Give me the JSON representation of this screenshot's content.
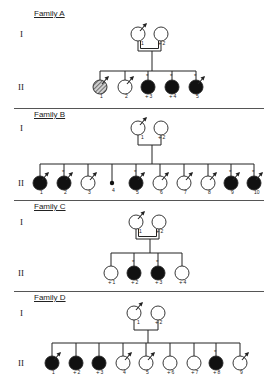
{
  "figure": {
    "generation_labels": [
      "I",
      "II"
    ],
    "colors": {
      "line": "#222222",
      "affected": "#111111",
      "unaffected": "#ffffff",
      "hatched": "#999999"
    }
  },
  "families": [
    {
      "title": "Family A",
      "y_title": 14,
      "y_gen1": 34,
      "y_gen2": 87,
      "consanguineous": true,
      "parents": [
        {
          "id": "1",
          "x": 138,
          "status": "unaffected",
          "arrow": true,
          "plus": false
        },
        {
          "id": "2",
          "x": 161,
          "status": "unaffected",
          "arrow": false,
          "plus": true
        }
      ],
      "sib_line_y": 71,
      "children": [
        {
          "id": "1",
          "x": 100,
          "status": "hatched",
          "arrow": true,
          "star": false,
          "plus": false
        },
        {
          "id": "2",
          "x": 125,
          "status": "unaffected",
          "arrow": true,
          "star": false,
          "plus": false
        },
        {
          "id": "3",
          "x": 148,
          "status": "affected",
          "arrow": false,
          "star": true,
          "plus": true
        },
        {
          "id": "4",
          "x": 172,
          "status": "affected",
          "arrow": false,
          "star": true,
          "plus": true
        },
        {
          "id": "5",
          "x": 196,
          "status": "affected",
          "arrow": true,
          "star": true,
          "plus": false
        }
      ]
    },
    {
      "title": "Family B",
      "y_title": 115,
      "y_gen1": 128,
      "y_gen2": 183,
      "consanguineous": false,
      "parents": [
        {
          "id": "1",
          "x": 138,
          "status": "unaffected",
          "arrow": true,
          "plus": false
        },
        {
          "id": "2",
          "x": 161,
          "status": "unaffected",
          "arrow": false,
          "plus": true
        }
      ],
      "sib_line_y": 164,
      "children": [
        {
          "id": "1",
          "x": 40,
          "status": "affected",
          "arrow": true,
          "star": false,
          "plus": false
        },
        {
          "id": "2",
          "x": 64,
          "status": "affected",
          "arrow": true,
          "star": true,
          "plus": false
        },
        {
          "id": "3",
          "x": 88,
          "status": "unaffected",
          "arrow": true,
          "star": false,
          "plus": false
        },
        {
          "id": "4",
          "x": 112,
          "status": "small",
          "arrow": false,
          "star": false,
          "plus": false
        },
        {
          "id": "5",
          "x": 136,
          "status": "affected",
          "arrow": true,
          "star": true,
          "plus": false
        },
        {
          "id": "6",
          "x": 160,
          "status": "unaffected",
          "arrow": true,
          "star": false,
          "plus": false
        },
        {
          "id": "7",
          "x": 184,
          "status": "unaffected",
          "arrow": true,
          "star": false,
          "plus": false
        },
        {
          "id": "8",
          "x": 208,
          "status": "unaffected",
          "arrow": true,
          "star": false,
          "plus": false
        },
        {
          "id": "9",
          "x": 231,
          "status": "affected",
          "arrow": true,
          "star": true,
          "plus": false
        },
        {
          "id": "10",
          "x": 254,
          "status": "affected",
          "arrow": true,
          "star": true,
          "plus": false
        }
      ]
    },
    {
      "title": "Family C",
      "y_title": 207,
      "y_gen1": 222,
      "y_gen2": 273,
      "consanguineous": true,
      "parents": [
        {
          "id": "1",
          "x": 136,
          "status": "unaffected",
          "arrow": true,
          "plus": false
        },
        {
          "id": "2",
          "x": 159,
          "status": "unaffected",
          "arrow": false,
          "plus": true
        }
      ],
      "sib_line_y": 253,
      "children": [
        {
          "id": "1",
          "x": 111,
          "status": "unaffected",
          "arrow": false,
          "star": false,
          "plus": true
        },
        {
          "id": "2",
          "x": 134,
          "status": "affected",
          "arrow": false,
          "star": true,
          "plus": true
        },
        {
          "id": "3",
          "x": 158,
          "status": "affected",
          "arrow": false,
          "star": true,
          "plus": true
        },
        {
          "id": "4",
          "x": 182,
          "status": "unaffected",
          "arrow": false,
          "star": false,
          "plus": true
        }
      ]
    },
    {
      "title": "Family D",
      "y_title": 298,
      "y_gen1": 313,
      "y_gen2": 363,
      "consanguineous": false,
      "parents": [
        {
          "id": "1",
          "x": 134,
          "status": "unaffected",
          "arrow": true,
          "plus": false
        },
        {
          "id": "2",
          "x": 158,
          "status": "unaffected",
          "arrow": false,
          "plus": true
        }
      ],
      "sib_line_y": 343,
      "children": [
        {
          "id": "1",
          "x": 52,
          "status": "affected",
          "arrow": true,
          "star": false,
          "plus": false
        },
        {
          "id": "2",
          "x": 76,
          "status": "affected",
          "arrow": false,
          "star": false,
          "plus": true
        },
        {
          "id": "3",
          "x": 99,
          "status": "affected",
          "arrow": false,
          "star": false,
          "plus": true
        },
        {
          "id": "4",
          "x": 123,
          "status": "unaffected",
          "arrow": true,
          "star": false,
          "plus": false
        },
        {
          "id": "5",
          "x": 146,
          "status": "unaffected",
          "arrow": true,
          "star": false,
          "plus": false
        },
        {
          "id": "6",
          "x": 170,
          "status": "unaffected",
          "arrow": false,
          "star": false,
          "plus": true
        },
        {
          "id": "7",
          "x": 194,
          "status": "unaffected",
          "arrow": false,
          "star": false,
          "plus": true
        },
        {
          "id": "8",
          "x": 216,
          "status": "affected",
          "arrow": false,
          "star": true,
          "plus": true
        },
        {
          "id": "9",
          "x": 240,
          "status": "unaffected",
          "arrow": true,
          "star": false,
          "plus": false
        }
      ]
    }
  ],
  "dividers_y": [
    108,
    200,
    291
  ]
}
